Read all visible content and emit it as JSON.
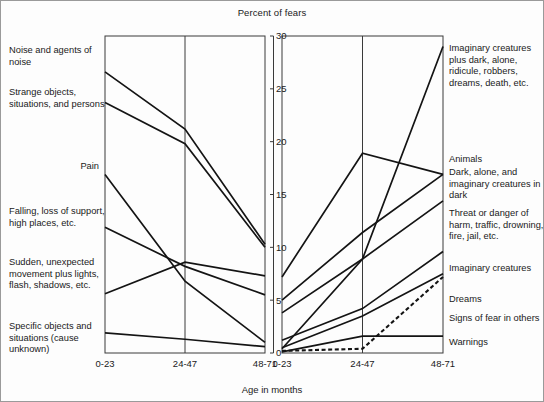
{
  "chart_data": {
    "type": "line",
    "title": "Percent of fears",
    "xlabel": "Age in months",
    "ylabel": "",
    "categories": [
      "0-23",
      "24-47",
      "48-71"
    ],
    "ylim": [
      0,
      30
    ],
    "yticks": [
      0,
      5,
      10,
      15,
      20,
      25,
      30
    ],
    "ytick_labels": [
      "0",
      "5",
      "10",
      "15",
      "20",
      "25",
      "30"
    ],
    "grid": false,
    "legend": "inline-side-labels",
    "panels": [
      {
        "name": "declining-fears",
        "position": "left",
        "label_side": "left",
        "series": [
          {
            "name": "Noise and agents of noise",
            "values": [
              26.6,
              21.2,
              10.3
            ],
            "style": "solid"
          },
          {
            "name": "Strange objects, situations, and persons",
            "values": [
              23.7,
              19.8,
              10.0
            ],
            "style": "solid"
          },
          {
            "name": "Pain",
            "values": [
              16.9,
              6.8,
              1.0
            ],
            "style": "solid"
          },
          {
            "name": "Falling, loss of support, high places, etc.",
            "values": [
              11.9,
              8.2,
              5.5
            ],
            "style": "solid"
          },
          {
            "name": "Sudden, unexpected movement plus lights, flash, shadows, etc.",
            "values": [
              5.6,
              8.6,
              7.3
            ],
            "style": "solid"
          },
          {
            "name": "Specific objects and situations (cause unknown)",
            "values": [
              1.9,
              1.3,
              0.6
            ],
            "style": "solid"
          }
        ]
      },
      {
        "name": "increasing-fears",
        "position": "right",
        "label_side": "right",
        "series": [
          {
            "name": "Imaginary creatures plus dark, alone, ridicule, robbers, dreams, death, etc.",
            "values": [
              0.4,
              8.9,
              29.0
            ],
            "style": "solid"
          },
          {
            "name": "Animals",
            "values": [
              7.2,
              18.9,
              16.9
            ],
            "style": "solid"
          },
          {
            "name": "Dark, alone, and imaginary creatures in dark",
            "values": [
              5.0,
              11.4,
              16.9
            ],
            "style": "solid"
          },
          {
            "name": "Threat or danger of harm, traffic, drowning, fire, jail, etc.",
            "values": [
              3.8,
              8.9,
              14.4
            ],
            "style": "solid"
          },
          {
            "name": "Imaginary creatures",
            "values": [
              1.2,
              4.2,
              9.6
            ],
            "style": "solid"
          },
          {
            "name": "Dreams",
            "values": [
              0.5,
              3.5,
              7.5
            ],
            "style": "solid"
          },
          {
            "name": "Signs of fear in others",
            "values": [
              0.2,
              0.4,
              7.2
            ],
            "style": "dashed"
          },
          {
            "name": "Warnings",
            "values": [
              0.1,
              1.6,
              1.6
            ],
            "style": "solid"
          }
        ]
      }
    ]
  },
  "labels_left": [
    {
      "text": "Noise and agents of noise",
      "top": 44,
      "align": "left"
    },
    {
      "text": "Strange objects, situations, and persons",
      "top": 86,
      "align": "left"
    },
    {
      "text": "Pain",
      "top": 160,
      "align": "right"
    },
    {
      "text": "Falling, loss of support, high places, etc.",
      "top": 205,
      "align": "left"
    },
    {
      "text": "Sudden, unexpected movement plus lights, flash, shadows, etc.",
      "top": 256,
      "align": "left"
    },
    {
      "text": "Specific objects and situations (cause unknown)",
      "top": 320,
      "align": "left"
    }
  ],
  "labels_right": [
    {
      "text": "Imaginary creatures plus dark, alone, ridicule, robbers, dreams, death, etc.",
      "top": 42
    },
    {
      "text": "Animals",
      "top": 153
    },
    {
      "text": "Dark, alone, and imaginary creatures in dark",
      "top": 166
    },
    {
      "text": "Threat or danger of harm, traffic, drowning, fire, jail, etc.",
      "top": 207
    },
    {
      "text": "Imaginary creatures",
      "top": 262
    },
    {
      "text": "Dreams",
      "top": 293
    },
    {
      "text": "Signs of fear in others",
      "top": 312
    },
    {
      "text": "Warnings",
      "top": 336
    }
  ]
}
